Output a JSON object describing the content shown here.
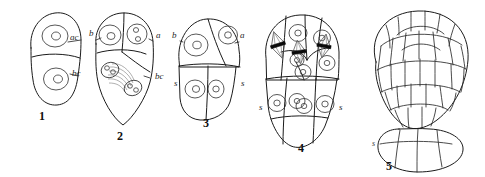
{
  "plate": {
    "background_color": "#ffffff",
    "ink_color": "#1b1b1b",
    "description": "Line-drawing plate of five successive plant embryo developmental stages"
  },
  "figures": [
    {
      "number": "1",
      "number_x": 42,
      "number_y": 120,
      "caption_role": "two-celled proembryo",
      "labels": [
        {
          "text": "ac",
          "x": 70,
          "y": 40,
          "meaning": "apical cell"
        },
        {
          "text": "bc",
          "x": 72,
          "y": 76,
          "meaning": "basal cell"
        }
      ]
    },
    {
      "number": "2",
      "number_x": 120,
      "number_y": 140,
      "caption_role": "four-celled stage with dividing basal cell",
      "labels": [
        {
          "text": "b",
          "x": 89,
          "y": 36,
          "meaning": "b cell"
        },
        {
          "text": "a",
          "x": 156,
          "y": 38,
          "meaning": "a cell"
        },
        {
          "text": "bc",
          "x": 155,
          "y": 79,
          "meaning": "basal cell"
        }
      ]
    },
    {
      "number": "3",
      "number_x": 206,
      "number_y": 127,
      "caption_role": "embryo with suspensor tier established",
      "labels": [
        {
          "text": "b",
          "x": 172,
          "y": 38,
          "meaning": "b cell"
        },
        {
          "text": "a",
          "x": 240,
          "y": 38,
          "meaning": "a cell"
        },
        {
          "text": "s",
          "x": 174,
          "y": 86,
          "meaning": "suspensor cell"
        },
        {
          "text": "s",
          "x": 241,
          "y": 86,
          "meaning": "suspensor cell"
        }
      ]
    },
    {
      "number": "4",
      "number_x": 301,
      "number_y": 152,
      "caption_role": "multicellular embryo with three mitotic spindles",
      "labels": [
        {
          "text": "s",
          "x": 259,
          "y": 110,
          "meaning": "suspensor cell"
        },
        {
          "text": "s",
          "x": 339,
          "y": 110,
          "meaning": "suspensor cell"
        }
      ],
      "spindle_count": 3
    },
    {
      "number": "5",
      "number_x": 389,
      "number_y": 170,
      "caption_role": "globular to heart-stage embryo with basal suspensor",
      "labels": [
        {
          "text": "s",
          "x": 372,
          "y": 146,
          "meaning": "suspensor"
        }
      ]
    }
  ]
}
